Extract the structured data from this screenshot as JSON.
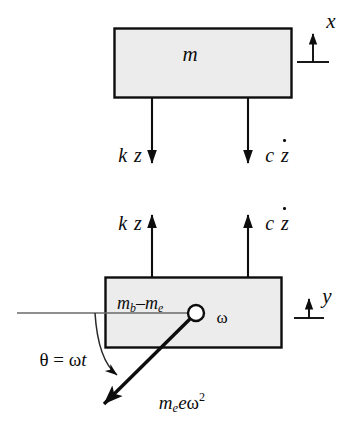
{
  "figure": {
    "type": "free-body-diagram",
    "background_color": "#ffffff",
    "stroke_color": "#0d0d0d",
    "block_fill_color": "#ececec",
    "reference_line_color": "#555555"
  },
  "blocks": [
    {
      "id": "upper-block",
      "label_main": "m",
      "label_sub": "",
      "x": 114,
      "y": 28,
      "width": 178,
      "height": 70
    },
    {
      "id": "lower-block",
      "label_main": "m",
      "label_sub": "b",
      "label_rest": "–m",
      "label_sub2": "e",
      "x": 105,
      "y": 277,
      "width": 177,
      "height": 71
    }
  ],
  "labels": {
    "upper_mass": "m",
    "lower_mass_prefix": "m",
    "lower_mass_sub1": "b",
    "lower_mass_middle": "–m",
    "lower_mass_sub2": "e",
    "coord_x": "x",
    "coord_y": "y",
    "spring_force": "k z",
    "spring_force_symbol": "k",
    "spring_force_var": "z",
    "damper_force_symbol": "c",
    "damper_force_var": "z",
    "angular_velocity": "ω",
    "angle_expression": "θ = ωt",
    "angle_symbol": "θ",
    "angle_equals": "=",
    "angle_omega": "ω",
    "angle_time": "t",
    "force_prefix": "m",
    "force_sub": "e",
    "force_e": "e",
    "force_omega": "ω",
    "force_exponent": "2"
  },
  "forces": [
    {
      "name": "spring-force-down",
      "label": "k z",
      "direction": "down",
      "x": 152,
      "y_start": 98,
      "y_end": 178,
      "acts_on": "upper-block"
    },
    {
      "name": "damper-force-down",
      "label": "c ż",
      "direction": "down",
      "x": 248,
      "y_start": 98,
      "y_end": 178,
      "acts_on": "upper-block"
    },
    {
      "name": "spring-force-up",
      "label": "k z",
      "direction": "up",
      "x": 152,
      "y_start": 277,
      "y_end": 200,
      "acts_on": "lower-block"
    },
    {
      "name": "damper-force-up",
      "label": "c ż",
      "direction": "up",
      "x": 248,
      "y_start": 277,
      "y_end": 200,
      "acts_on": "lower-block"
    },
    {
      "name": "centrifugal-force",
      "label": "m_e e ω²",
      "direction": "down-left",
      "from_x": 196,
      "from_y": 313,
      "to_x": 104,
      "to_y": 404,
      "acts_on": "lower-block"
    }
  ],
  "coordinate_markers": [
    {
      "name": "x-marker",
      "label": "x",
      "x": 313,
      "base_y": 62,
      "tip_y": 22,
      "baseline_half_width": 16
    },
    {
      "name": "y-marker",
      "label": "y",
      "x": 309,
      "base_y": 318,
      "tip_y": 288,
      "baseline_half_width": 15
    }
  ],
  "rotating_mass": {
    "hub_center_x": 196,
    "hub_center_y": 313,
    "hub_radius": 8,
    "angular_velocity_label": "ω",
    "reference_line_x_start": 17,
    "reference_line_x_end": 196,
    "reference_line_y": 313,
    "angle_arc_label": "θ = ωt"
  }
}
